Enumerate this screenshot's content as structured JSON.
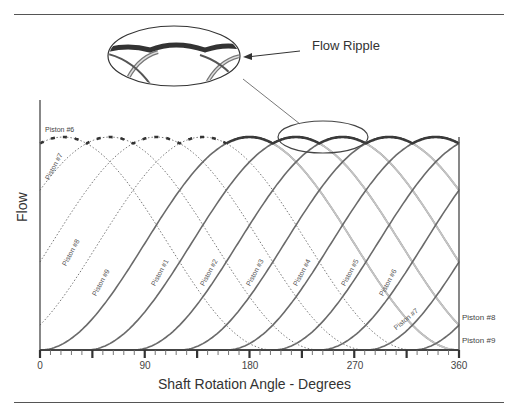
{
  "figure": {
    "callout_label": "Flow Ripple",
    "y_axis_label": "Flow",
    "x_axis_label": "Shaft Rotation Angle - Degrees"
  },
  "chart_data": {
    "type": "line",
    "title": "",
    "xlabel": "Shaft Rotation Angle - Degrees",
    "ylabel": "Flow",
    "xlim": [
      0,
      360
    ],
    "ylim": [
      0,
      1
    ],
    "x_ticks": [
      0,
      90,
      180,
      270,
      360
    ],
    "major_tick_step": 45,
    "minor_tick_step": 9,
    "grid": false,
    "legend": "inline labels on curves",
    "model": "flow_k(theta) = (1 - cos(theta - phase_k)) / 2, 360-degree pulse, phase step 40 degrees",
    "series": [
      {
        "name": "Piston #1",
        "phase_deg": 0,
        "style": "solid"
      },
      {
        "name": "Piston #2",
        "phase_deg": 40,
        "style": "solid"
      },
      {
        "name": "Piston #3",
        "phase_deg": 80,
        "style": "solid"
      },
      {
        "name": "Piston #4",
        "phase_deg": 120,
        "style": "solid"
      },
      {
        "name": "Piston #5",
        "phase_deg": 160,
        "style": "solid"
      },
      {
        "name": "Piston #6",
        "phase_deg": 200,
        "style": "solid"
      },
      {
        "name": "Piston #7",
        "phase_deg": 240,
        "style": "solid"
      },
      {
        "name": "Piston #8",
        "phase_deg": 280,
        "style": "solid"
      },
      {
        "name": "Piston #9",
        "phase_deg": 320,
        "style": "solid"
      },
      {
        "name": "Piston #6 (prev. cycle)",
        "phase_deg": -160,
        "style": "dotted"
      },
      {
        "name": "Piston #7 (prev. cycle)",
        "phase_deg": -120,
        "style": "dotted"
      },
      {
        "name": "Piston #8 (prev. cycle)",
        "phase_deg": -80,
        "style": "dotted"
      },
      {
        "name": "Piston #9 (prev. cycle)",
        "phase_deg": -40,
        "style": "dotted"
      }
    ],
    "envelope": {
      "name": "Total flow (ripple)",
      "style": "thick",
      "dotted_before_deg": 160
    },
    "annotations": [
      "Flow Ripple",
      "Piston #6",
      "Piston #7",
      "Piston #8",
      "Piston #9",
      "Piston #1",
      "Piston #2",
      "Piston #3",
      "Piston #4",
      "Piston #5",
      "Piston #6",
      "Piston #7",
      "Piston #8",
      "Piston #9"
    ]
  },
  "labels": {
    "ticks": [
      "0",
      "90",
      "180",
      "270",
      "360"
    ],
    "end_labels": {
      "p8": "Piston #8",
      "p9": "Piston #9"
    },
    "top_left": "Piston #6",
    "dotted": {
      "p7": "Piston #7",
      "p8": "Piston #8",
      "p9": "Piston #9"
    },
    "solid": {
      "p1": "Piston #1",
      "p2": "Piston #2",
      "p3": "Piston #3",
      "p4": "Piston #4",
      "p5": "Piston #5",
      "p6": "Piston #6",
      "p7": "Piston #7"
    }
  }
}
